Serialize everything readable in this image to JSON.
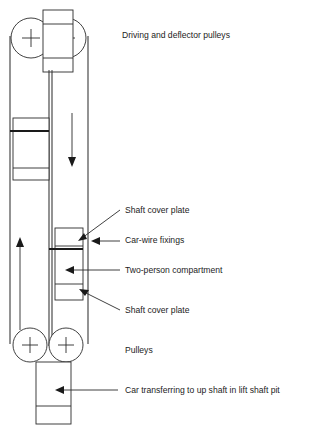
{
  "diagram": {
    "colors": {
      "line": "#2b2b2b",
      "wall": "#3a3a3a",
      "accent_thick": "#1a1a1a",
      "background": "#ffffff",
      "text": "#1c1c1c"
    },
    "labels": [
      {
        "id": "driving-and-deflector-pulleys",
        "text": "Driving and deflector pulleys",
        "x": 122,
        "y": 36
      },
      {
        "id": "shaft-cover-plate-top",
        "text": "Shaft cover plate",
        "x": 125,
        "y": 211
      },
      {
        "id": "car-wire-fixings",
        "text": "Car-wire fixings",
        "x": 125,
        "y": 241
      },
      {
        "id": "two-person-compartment",
        "text": "Two-person compartment",
        "x": 125,
        "y": 271
      },
      {
        "id": "shaft-cover-plate-bottom",
        "text": "Shaft cover plate",
        "x": 125,
        "y": 311
      },
      {
        "id": "pulleys",
        "text": "Pulleys",
        "x": 125,
        "y": 351
      },
      {
        "id": "car-transferring",
        "text": "Car transferring to up shaft in lift shaft pit",
        "x": 125,
        "y": 391
      }
    ],
    "parts": {
      "top_pulley_left": {
        "name": "driving-pulley",
        "cx": 31,
        "cy": 38,
        "r": 20
      },
      "top_pulley_right": {
        "name": "deflector-pulley",
        "cx": 66,
        "cy": 38,
        "r": 20
      },
      "bottom_pulley_left": {
        "name": "bottom-pulley-left",
        "cx": 30,
        "cy": 345,
        "r": 17
      },
      "bottom_pulley_right": {
        "name": "bottom-pulley-right",
        "cx": 66,
        "cy": 345,
        "r": 17
      },
      "machine_box": {
        "name": "machine-room-box",
        "x": 43,
        "y": 10,
        "w": 30,
        "h": 62
      },
      "counterweight": {
        "name": "counterweight",
        "x": 13,
        "y": 118,
        "w": 36,
        "h": 62
      },
      "car_compartment": {
        "name": "two-person-compartment-box",
        "x": 55,
        "y": 228,
        "w": 28,
        "h": 72
      },
      "car_bottom": {
        "name": "car-in-pit-box",
        "x": 36,
        "y": 362,
        "w": 35,
        "h": 62
      },
      "left_shaft_wall_x": 10,
      "right_shaft_wall_x": 88,
      "mid_wall_x": 49
    },
    "flow_arrows": [
      {
        "id": "down-arrow-counterweight-shaft",
        "direction": "down",
        "x": 72,
        "y_start": 113,
        "y_end": 165
      },
      {
        "id": "up-arrow-car-shaft",
        "direction": "up",
        "x": 20,
        "y_start": 330,
        "y_end": 237
      }
    ]
  }
}
